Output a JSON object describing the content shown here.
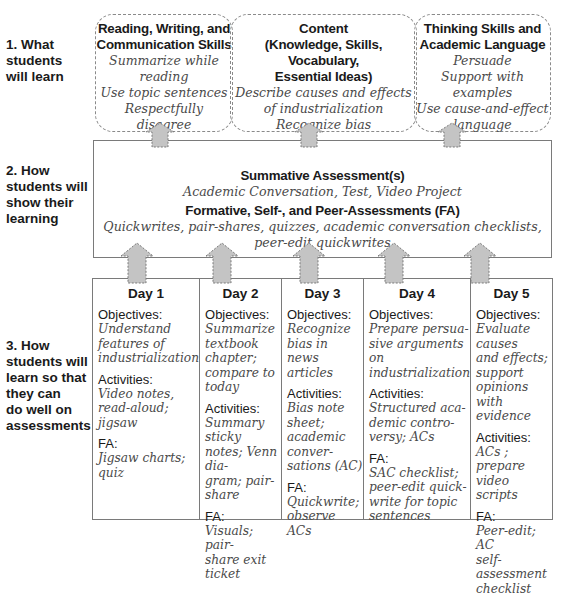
{
  "row_labels": {
    "row1": [
      "1. What",
      "students",
      "will learn"
    ],
    "row2": [
      "2.  How",
      "students will",
      "show their",
      "learning"
    ],
    "row3": [
      "3. How",
      "students will",
      "learn so that",
      "they can",
      "do well on",
      "assessments"
    ]
  },
  "learning_boxes": [
    {
      "title": [
        "Reading, Writing, and",
        "Communication Skills"
      ],
      "items": [
        "Summarize while reading",
        "Use topic sentences",
        "Respectfully disagree"
      ]
    },
    {
      "title": [
        "Content",
        "(Knowledge, Skills, Vocabulary,",
        "Essential Ideas)"
      ],
      "items": [
        "Describe causes and effects",
        "of industrialization",
        "Recognize bias"
      ]
    },
    {
      "title": [
        "Thinking Skills and",
        "Academic Language"
      ],
      "items": [
        "Persuade",
        "Support with examples",
        "Use cause-and-effect",
        "language"
      ]
    }
  ],
  "assessment_box": {
    "summative_title": "Summative Assessment(s)",
    "summative_text": "Academic Conversation, Test, Video Project",
    "formative_title": "Formative, Self-, and Peer-Assessments (FA)",
    "formative_text": "Quickwrites, pair-shares, quizzes, academic conversation checklists, peer-edit quickwrites"
  },
  "section_labels": {
    "objectives": "Objectives:",
    "activities": "Activities:",
    "fa": "FA:"
  },
  "days": [
    {
      "title": "Day 1",
      "objectives": [
        "Understand",
        "features of",
        "industrialization"
      ],
      "activities": [
        "Video notes,",
        "read-aloud;",
        "jigsaw"
      ],
      "fa": [
        "Jigsaw charts;",
        "quiz"
      ]
    },
    {
      "title": "Day 2",
      "objectives": [
        "Summarize",
        "textbook chapter;",
        "compare to",
        "today"
      ],
      "activities": [
        "Summary sticky",
        "notes; Venn dia-",
        "gram; pair-share"
      ],
      "fa": [
        "Visuals; pair-",
        "share exit ticket"
      ]
    },
    {
      "title": "Day 3",
      "objectives": [
        "Recognize bias in",
        "news articles"
      ],
      "activities": [
        "Bias note sheet;",
        "academic conver-",
        "sations (AC)"
      ],
      "fa": [
        "Quickwrite;",
        "observe ACs"
      ]
    },
    {
      "title": "Day 4",
      "objectives": [
        "Prepare persua-",
        "sive arguments on",
        "industrialization"
      ],
      "activities": [
        "Structured aca-",
        "demic contro-",
        "versy; ACs"
      ],
      "fa": [
        "SAC checklist;",
        "peer-edit quick-",
        "write for topic",
        "sentences"
      ]
    },
    {
      "title": "Day 5",
      "objectives": [
        "Evaluate causes",
        "and effects;",
        "support opinions",
        "with evidence"
      ],
      "activities": [
        "ACs ; prepare",
        "video scripts"
      ],
      "fa": [
        "Peer-edit; AC",
        "self-assessment",
        "checklist"
      ]
    }
  ],
  "colors": {
    "arrow_fill": "#c4c4c4",
    "arrow_border": "#7a7a7a",
    "box_border": "#7a7a7a",
    "handwriting_text": "#4a4a4a"
  }
}
